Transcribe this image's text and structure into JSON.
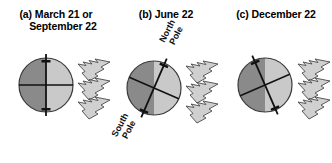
{
  "figure": {
    "background_color": "#ffffff",
    "panels": [
      {
        "id": "a",
        "caption_line1": "(a) March 21 or",
        "caption_line2": "September 22",
        "axis_tilt_deg": 0,
        "north_pole_label": "",
        "south_pole_label": "",
        "sunray_count": 3,
        "sunray_direction": "leftward"
      },
      {
        "id": "b",
        "caption_line1": "(b) June 22",
        "caption_line2": "",
        "axis_tilt_deg": 23.5,
        "north_pole_label_line1": "North",
        "north_pole_label_line2": "Pole",
        "south_pole_label_line1": "South",
        "south_pole_label_line2": "Pole",
        "sunray_count": 3,
        "sunray_direction": "leftward"
      },
      {
        "id": "c",
        "caption_line1": "(c) December 22",
        "caption_line2": "",
        "axis_tilt_deg": -23.5,
        "north_pole_label": "",
        "south_pole_label": "",
        "sunray_count": 3,
        "sunray_direction": "leftward"
      }
    ],
    "colors": {
      "night_half": "#8a8a8a",
      "day_half": "#c9c9c9",
      "globe_outline": "#3a3a3a",
      "axis_line": "#111111",
      "equator_line": "#111111",
      "sunray_fill": "#d0d0d0",
      "sunray_outline": "#4a4a4a",
      "text": "#000000"
    },
    "globe": {
      "radius_px": 27,
      "terminator": "vertical",
      "shaded_side": "left",
      "lit_side": "right"
    }
  }
}
